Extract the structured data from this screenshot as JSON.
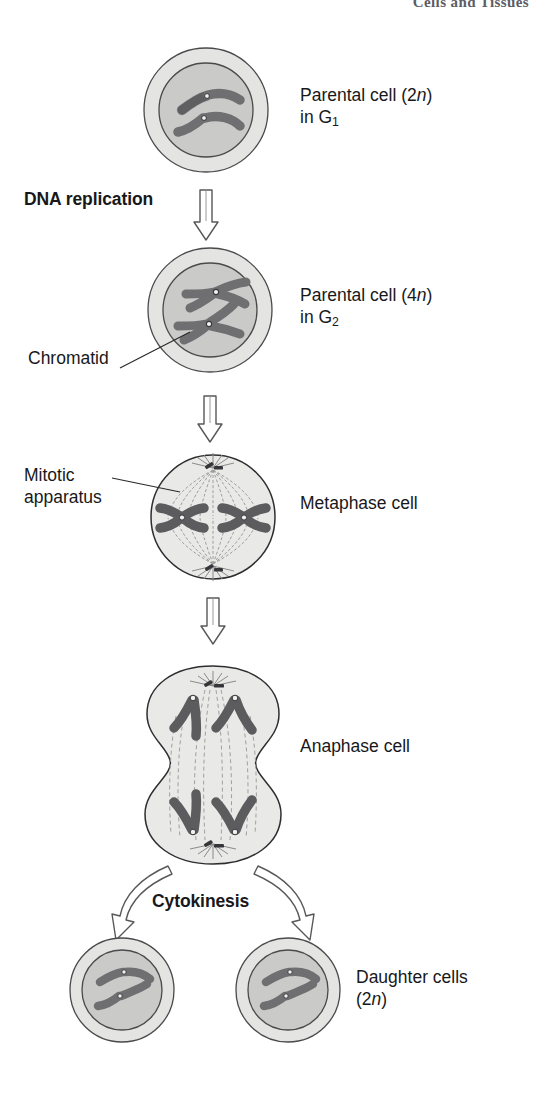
{
  "running_head": "Cells and Tissues",
  "figure": {
    "stages": [
      {
        "id": "g1-cell",
        "label_lines": [
          "Parental cell (2n)",
          "in G1"
        ],
        "label_line1_pre": "Parental cell (2",
        "label_line1_ital": "n",
        "label_line1_post": ")",
        "label_line2_pre": "in G",
        "label_line2_sub": "1",
        "ploidy": "2n",
        "phase": "G1",
        "chromosome_count": 2,
        "chromosome_shape": "V-shaped unreplicated"
      },
      {
        "id": "g2-cell",
        "label_line1_pre": "Parental cell (4",
        "label_line1_ital": "n",
        "label_line1_post": ")",
        "label_line2_pre": "in G",
        "label_line2_sub": "2",
        "ploidy": "4n",
        "phase": "G2",
        "chromosome_count": 2,
        "chromosome_shape": "X-shaped replicated (sister chromatids)"
      },
      {
        "id": "metaphase-cell",
        "label": "Metaphase cell",
        "chromosome_count": 2,
        "chromosome_shape": "X-shaped aligned at equator"
      },
      {
        "id": "anaphase-cell",
        "label": "Anaphase cell",
        "chromosome_count": 4,
        "chromosome_shape": "V-shaped migrating to poles"
      },
      {
        "id": "daughter-cells",
        "label_line1": "Daughter cells",
        "label_line2_pre": "(2",
        "label_line2_ital": "n",
        "label_line2_post": ")",
        "ploidy": "2n",
        "cell_count": 2,
        "chromosome_count": 2
      }
    ],
    "process_labels": [
      {
        "id": "dna-replication",
        "text": "DNA replication",
        "bold": true
      },
      {
        "id": "cytokinesis",
        "text": "Cytokinesis",
        "bold": true
      }
    ],
    "callouts": [
      {
        "id": "chromatid",
        "text": "Chromatid"
      },
      {
        "id": "mitotic-apparatus",
        "line1": "Mitotic",
        "line2": "apparatus"
      }
    ],
    "colors": {
      "cytoplasm": "#e2e2e0",
      "nucleus": "#c9c9c7",
      "chromosome": "#6e6e70",
      "chromosome_stroke": "#2e2e30",
      "outline": "#3a3a3c",
      "spindle": "#9a9a98",
      "text": "#18181a",
      "running_head": "#5d5d66",
      "background": "#ffffff"
    }
  }
}
